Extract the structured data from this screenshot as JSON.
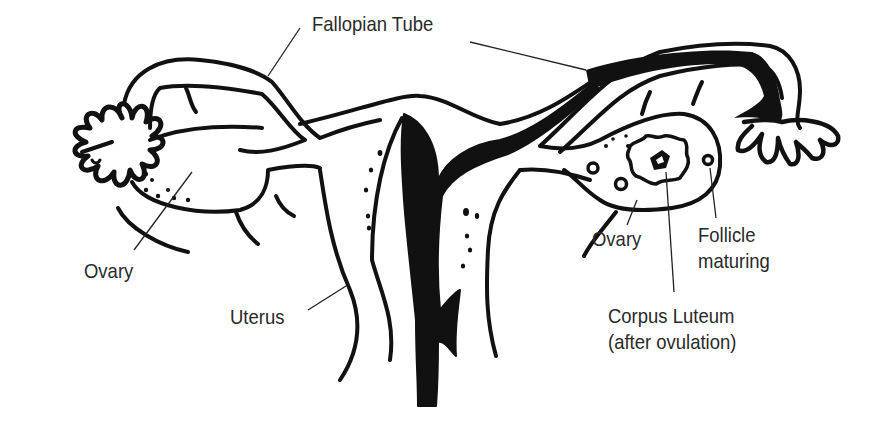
{
  "diagram": {
    "type": "anatomical line drawing",
    "colors": {
      "ink": "#111111",
      "background": "#ffffff",
      "label_text": "#2a2a2a"
    },
    "labels": [
      {
        "id": "fallopian_tube",
        "text": "Fallopian Tube"
      },
      {
        "id": "ovary_left",
        "text": "Ovary"
      },
      {
        "id": "uterus",
        "text": "Uterus"
      },
      {
        "id": "ovary_right",
        "text": "Ovary"
      },
      {
        "id": "follicle_line1",
        "text": "Follicle"
      },
      {
        "id": "follicle_line2",
        "text": "maturing"
      },
      {
        "id": "corpus_line1",
        "text": "Corpus Luteum"
      },
      {
        "id": "corpus_line2",
        "text": "(after ovulation)"
      }
    ]
  }
}
